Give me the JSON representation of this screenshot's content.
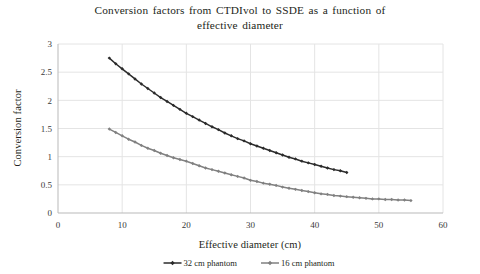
{
  "chart_data": {
    "type": "line",
    "title": "Conversion factors from CTDIvol to SSDE as a function of effective diameter",
    "title_line1": "Conversion factors from CTDIvol to SSDE as a function of",
    "title_line2": "effective diameter",
    "xlabel": "Effective diameter (cm)",
    "ylabel": "Conversion factor",
    "xlim": [
      0,
      60
    ],
    "ylim": [
      0,
      3
    ],
    "xticks": [
      0,
      10,
      20,
      30,
      40,
      50,
      60
    ],
    "yticks": [
      0,
      0.5,
      1,
      1.5,
      2,
      2.5,
      3
    ],
    "xtick_labels": [
      "0",
      "10",
      "20",
      "30",
      "40",
      "50",
      "60"
    ],
    "ytick_labels": [
      "0",
      "0.5",
      "1",
      "1.5",
      "2",
      "2.5",
      "3"
    ],
    "grid": "horizontal-and-vertical",
    "grid_color": "#e4e4e4",
    "legend_position": "bottom",
    "marker": "diamond",
    "series": [
      {
        "name": "32 cm phantom",
        "color": "#2b2b2b",
        "x": [
          8,
          9,
          10,
          11,
          12,
          13,
          14,
          15,
          16,
          17,
          18,
          19,
          20,
          21,
          22,
          23,
          24,
          25,
          26,
          27,
          28,
          29,
          30,
          31,
          32,
          33,
          34,
          35,
          36,
          37,
          38,
          39,
          40,
          41,
          42,
          43,
          44,
          45
        ],
        "values": [
          2.75,
          2.65,
          2.56,
          2.47,
          2.38,
          2.29,
          2.21,
          2.13,
          2.05,
          1.98,
          1.91,
          1.84,
          1.77,
          1.71,
          1.65,
          1.59,
          1.53,
          1.48,
          1.42,
          1.37,
          1.32,
          1.28,
          1.23,
          1.19,
          1.15,
          1.11,
          1.07,
          1.03,
          0.99,
          0.96,
          0.92,
          0.89,
          0.86,
          0.83,
          0.8,
          0.77,
          0.75,
          0.72
        ]
      },
      {
        "name": "16 cm phantom",
        "color": "#808080",
        "x": [
          8,
          9,
          10,
          11,
          12,
          13,
          14,
          15,
          16,
          17,
          18,
          19,
          20,
          21,
          22,
          23,
          24,
          25,
          26,
          27,
          28,
          29,
          30,
          31,
          32,
          33,
          34,
          35,
          36,
          37,
          38,
          39,
          40,
          41,
          42,
          43,
          44,
          45,
          46,
          47,
          48,
          49,
          50,
          51,
          52,
          53,
          54,
          55
        ],
        "values": [
          1.49,
          1.43,
          1.37,
          1.31,
          1.26,
          1.2,
          1.15,
          1.11,
          1.06,
          1.02,
          0.98,
          0.95,
          0.92,
          0.88,
          0.84,
          0.8,
          0.77,
          0.74,
          0.71,
          0.68,
          0.65,
          0.62,
          0.58,
          0.56,
          0.53,
          0.51,
          0.49,
          0.46,
          0.44,
          0.42,
          0.4,
          0.38,
          0.36,
          0.34,
          0.33,
          0.31,
          0.3,
          0.29,
          0.28,
          0.27,
          0.26,
          0.25,
          0.25,
          0.24,
          0.24,
          0.23,
          0.23,
          0.22
        ]
      }
    ]
  }
}
